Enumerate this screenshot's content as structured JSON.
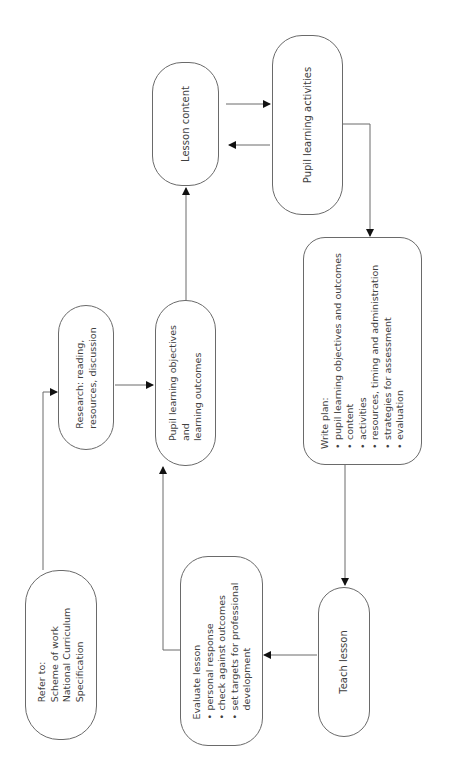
{
  "diagram": {
    "orientation": "rotated-90-counterclockwise",
    "colors": {
      "stroke": "#6a6a6a",
      "text": "#3f3f3f",
      "background": "#ffffff",
      "arrowhead": "#111111"
    },
    "nodes": {
      "refer": {
        "title": "Refer to:",
        "lines": [
          "Scheme of work",
          "National Curriculum",
          "Specification"
        ]
      },
      "research": {
        "lines": [
          "Research: reading,",
          "resources, discussion"
        ]
      },
      "objectives": {
        "lines": [
          "Pupil learning objectives",
          "and",
          "learning outcomes"
        ]
      },
      "lesson_content": {
        "label": "Lesson content"
      },
      "activities": {
        "label": "Pupil learning activities"
      },
      "write_plan": {
        "title": "Write plan:",
        "bullets": [
          "pupil learning objectives and outcomes",
          "content",
          "activities",
          "resources, timing and administration",
          "strategies for assessment",
          "evaluation"
        ]
      },
      "teach": {
        "label": "Teach lesson"
      },
      "evaluate": {
        "title": "Evaluate lesson",
        "bullets": [
          "personal response",
          "check against outcomes",
          "set targets for professional",
          "development"
        ]
      }
    },
    "edges": [
      {
        "from": "Refer to",
        "to": "Research"
      },
      {
        "from": "Research",
        "to": "Pupil learning objectives and learning outcomes"
      },
      {
        "from": "Evaluate lesson",
        "to": "Pupil learning objectives and learning outcomes"
      },
      {
        "from": "Pupil learning objectives and learning outcomes",
        "to": "Lesson content"
      },
      {
        "from": "Lesson content",
        "to": "Pupil learning activities"
      },
      {
        "from": "Pupil learning activities",
        "to": "Lesson content"
      },
      {
        "from": "Pupil learning activities",
        "to": "Write plan"
      },
      {
        "from": "Write plan",
        "to": "Teach lesson"
      },
      {
        "from": "Teach lesson",
        "to": "Evaluate lesson"
      }
    ]
  }
}
